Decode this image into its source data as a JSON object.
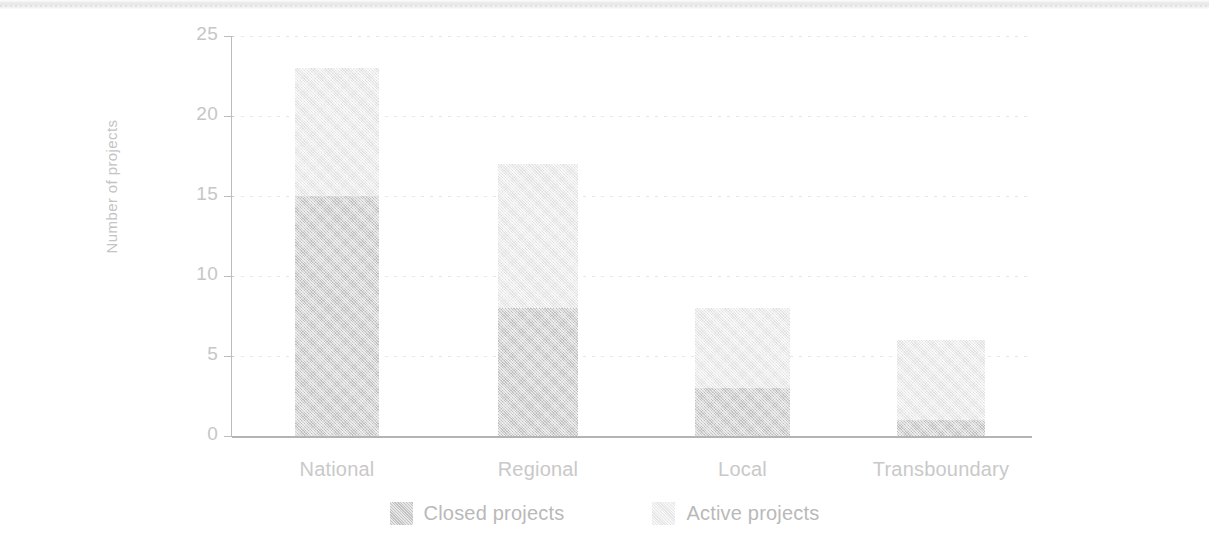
{
  "chart_data": {
    "type": "bar",
    "subtype": "stacked-bar",
    "title": "",
    "xlabel": "",
    "ylabel": "Number of projects",
    "categories": [
      "National",
      "Regional",
      "Local",
      "Transboundary"
    ],
    "series": [
      {
        "name": "Closed projects",
        "color": "#c9c9c9",
        "values": [
          15,
          8,
          3,
          1
        ]
      },
      {
        "name": "Active projects",
        "color": "#ededed",
        "values": [
          8,
          9,
          5,
          5
        ]
      }
    ],
    "totals": [
      23,
      17,
      8,
      6
    ],
    "ylim": [
      0,
      25
    ],
    "ytick_labels": [
      "25",
      "20",
      "15",
      "10",
      "5",
      "0"
    ],
    "ytick_values": [
      25,
      20,
      15,
      10,
      5,
      0
    ],
    "grid": true,
    "grid_axis": "y",
    "legend_position": "bottom-center",
    "stack_order": "closed-bottom-active-top"
  },
  "axis": {
    "y_title": "Number of projects"
  },
  "legend": {
    "items": [
      {
        "label": "Closed projects",
        "swatch": "#c9c9c9"
      },
      {
        "label": "Active projects",
        "swatch": "#ededed"
      }
    ]
  }
}
